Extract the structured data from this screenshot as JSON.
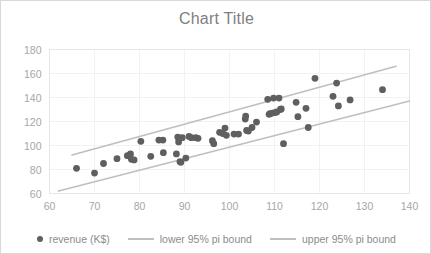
{
  "chart_data": {
    "type": "scatter",
    "title": "Chart Title",
    "xlabel": "",
    "ylabel": "",
    "xlim": [
      60,
      140
    ],
    "ylim": [
      60,
      180
    ],
    "xticks": [
      60,
      70,
      80,
      90,
      100,
      110,
      120,
      130,
      140
    ],
    "yticks": [
      60,
      80,
      100,
      120,
      140,
      160,
      180
    ],
    "grid": true,
    "legend_position": "bottom",
    "colors": {
      "marker": "#5f5f5f",
      "pi_line": "#bfbfbf",
      "gridline": "#f2f2f2",
      "plot_border": "#e6e6e6",
      "title_text": "#7f7f7f",
      "tick_text": "#a6a6a6",
      "legend_text": "#8c8c8c",
      "frame_border": "#d9d9d9",
      "background": "#ffffff"
    },
    "series": [
      {
        "name": "revenue (K$)",
        "type": "scatter",
        "marker": "circle",
        "points": [
          [
            66.0,
            81.0
          ],
          [
            70.0,
            77.0
          ],
          [
            72.0,
            85.0
          ],
          [
            75.0,
            89.0
          ],
          [
            77.3,
            91.5
          ],
          [
            78.0,
            93.0
          ],
          [
            78.2,
            88.5
          ],
          [
            78.8,
            88.0
          ],
          [
            80.3,
            103.5
          ],
          [
            82.5,
            91.0
          ],
          [
            84.3,
            104.5
          ],
          [
            85.2,
            104.5
          ],
          [
            85.3,
            94.0
          ],
          [
            88.2,
            93.0
          ],
          [
            88.5,
            107.0
          ],
          [
            88.7,
            103.0
          ],
          [
            89.0,
            86.5
          ],
          [
            89.2,
            86.0
          ],
          [
            89.5,
            106.5
          ],
          [
            90.3,
            89.5
          ],
          [
            91.0,
            107.5
          ],
          [
            91.5,
            106.5
          ],
          [
            92.5,
            106.5
          ],
          [
            93.0,
            106.0
          ],
          [
            96.2,
            104.0
          ],
          [
            96.5,
            101.5
          ],
          [
            97.8,
            111.0
          ],
          [
            98.5,
            110.0
          ],
          [
            99.0,
            114.5
          ],
          [
            99.3,
            108.5
          ],
          [
            101.0,
            109.5
          ],
          [
            102.0,
            109.5
          ],
          [
            103.5,
            122.0
          ],
          [
            103.6,
            124.5
          ],
          [
            103.8,
            112.5
          ],
          [
            104.2,
            112.0
          ],
          [
            105.0,
            115.0
          ],
          [
            106.0,
            119.5
          ],
          [
            108.5,
            138.5
          ],
          [
            108.8,
            126.0
          ],
          [
            109.0,
            126.5
          ],
          [
            109.5,
            127.0
          ],
          [
            109.8,
            139.5
          ],
          [
            110.2,
            127.5
          ],
          [
            110.5,
            128.0
          ],
          [
            111.0,
            139.5
          ],
          [
            111.3,
            130.0
          ],
          [
            111.5,
            130.5
          ],
          [
            112.0,
            101.5
          ],
          [
            114.8,
            136.0
          ],
          [
            115.2,
            124.0
          ],
          [
            117.0,
            131.0
          ],
          [
            117.5,
            115.0
          ],
          [
            119.0,
            156.0
          ],
          [
            123.0,
            141.0
          ],
          [
            123.8,
            152.0
          ],
          [
            124.2,
            133.0
          ],
          [
            126.8,
            138.0
          ],
          [
            134.0,
            146.5
          ]
        ]
      },
      {
        "name": "lower 95% pi bound",
        "type": "line",
        "points": [
          [
            62.0,
            62.0
          ],
          [
            140.0,
            137.0
          ]
        ]
      },
      {
        "name": "upper 95% pi bound",
        "type": "line",
        "points": [
          [
            65.0,
            92.0
          ],
          [
            137.0,
            166.0
          ]
        ]
      }
    ]
  },
  "legend": {
    "items": [
      {
        "label": "revenue (K$)",
        "marker": "dot"
      },
      {
        "label": "lower 95% pi bound",
        "marker": "line"
      },
      {
        "label": "upper 95% pi bound",
        "marker": "line"
      }
    ]
  }
}
